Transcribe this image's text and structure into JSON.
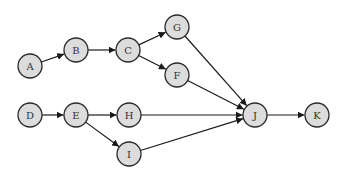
{
  "diagram": {
    "type": "directed-graph",
    "node_fill": "#dcdcdc",
    "node_stroke": "#2a2a2a",
    "edge_color": "#1a1a1a",
    "node_radius": 12,
    "nodes": [
      {
        "id": "A",
        "label": "A",
        "x": 30,
        "y": 66
      },
      {
        "id": "B",
        "label": "B",
        "x": 76,
        "y": 50
      },
      {
        "id": "C",
        "label": "C",
        "x": 128,
        "y": 50
      },
      {
        "id": "G",
        "label": "G",
        "x": 177,
        "y": 27
      },
      {
        "id": "F",
        "label": "F",
        "x": 177,
        "y": 75
      },
      {
        "id": "D",
        "label": "D",
        "x": 30,
        "y": 115
      },
      {
        "id": "E",
        "label": "E",
        "x": 76,
        "y": 115
      },
      {
        "id": "H",
        "label": "H",
        "x": 129,
        "y": 115
      },
      {
        "id": "I",
        "label": "I",
        "x": 129,
        "y": 154
      },
      {
        "id": "J",
        "label": "J",
        "x": 255,
        "y": 115
      },
      {
        "id": "K",
        "label": "K",
        "x": 317,
        "y": 115
      }
    ],
    "edges": [
      {
        "from": "A",
        "to": "B"
      },
      {
        "from": "B",
        "to": "C"
      },
      {
        "from": "C",
        "to": "G"
      },
      {
        "from": "C",
        "to": "F"
      },
      {
        "from": "G",
        "to": "J"
      },
      {
        "from": "F",
        "to": "J"
      },
      {
        "from": "D",
        "to": "E"
      },
      {
        "from": "E",
        "to": "H"
      },
      {
        "from": "E",
        "to": "I"
      },
      {
        "from": "H",
        "to": "J"
      },
      {
        "from": "I",
        "to": "J"
      },
      {
        "from": "J",
        "to": "K"
      }
    ]
  }
}
